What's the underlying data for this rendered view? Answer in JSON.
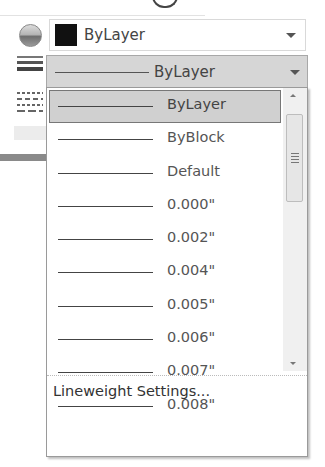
{
  "properties_panel": {
    "color_combo": {
      "selected_label": "ByLayer",
      "swatch_color": "#111111"
    },
    "lineweight_combo": {
      "selected_label": "ByLayer",
      "expanded": true
    },
    "lineweight_dropdown": {
      "items": [
        {
          "label": "ByLayer",
          "selected": true
        },
        {
          "label": "ByBlock",
          "selected": false
        },
        {
          "label": "Default",
          "selected": false
        },
        {
          "label": "0.000\"",
          "selected": false
        },
        {
          "label": "0.002\"",
          "selected": false
        },
        {
          "label": "0.004\"",
          "selected": false
        },
        {
          "label": "0.005\"",
          "selected": false
        },
        {
          "label": "0.006\"",
          "selected": false
        },
        {
          "label": "0.007\"",
          "selected": false
        },
        {
          "label": "0.008\"",
          "selected": false
        }
      ],
      "footer_label": "Lineweight Settings..."
    },
    "icons": {
      "color": "color-wheel-icon",
      "lineweight": "lineweight-icon",
      "linetype": "linetype-icon"
    }
  }
}
